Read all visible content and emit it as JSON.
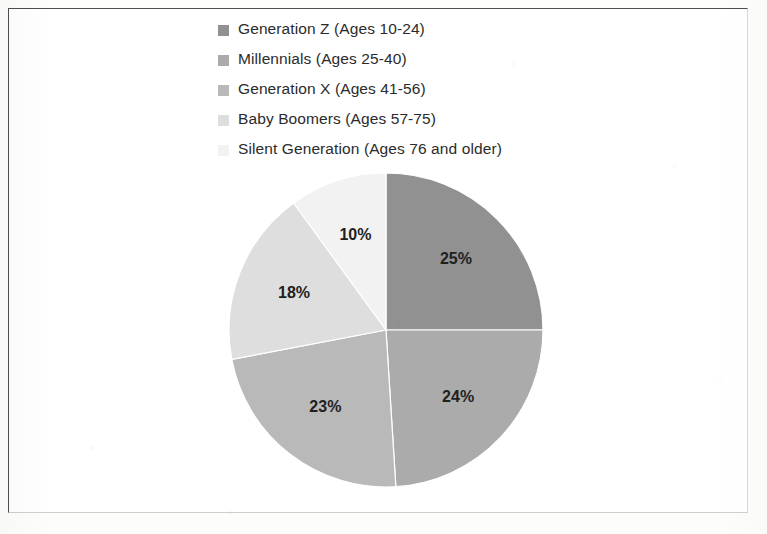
{
  "chart_data": {
    "type": "pie",
    "title": "",
    "subtitle": "",
    "xlabel": "",
    "ylabel": "",
    "grid": false,
    "legend_position": "top-left",
    "start_angle_deg": 0,
    "direction": "clockwise",
    "categories": [
      "Generation Z (Ages 10-24)",
      "Millennials (Ages 25-40)",
      "Generation X (Ages 41-56)",
      "Baby Boomers (Ages 57-75)",
      "Silent Generation (Ages 76 and older)"
    ],
    "values": [
      25,
      24,
      23,
      18,
      10
    ],
    "data_labels": [
      "25%",
      "24%",
      "23%",
      "18%",
      "10%"
    ],
    "colors": [
      "#919191",
      "#ababab",
      "#b9b9b9",
      "#dedede",
      "#f2f2f2"
    ],
    "units": "percent"
  },
  "legend": {
    "items": [
      {
        "label": "Generation Z (Ages 10-24)",
        "color": "#919191"
      },
      {
        "label": "Millennials (Ages 25-40)",
        "color": "#ababab"
      },
      {
        "label": "Generation X (Ages 41-56)",
        "color": "#b9b9b9"
      },
      {
        "label": "Baby Boomers (Ages 57-75)",
        "color": "#dedede"
      },
      {
        "label": "Silent Generation (Ages 76 and older)",
        "color": "#f2f2f2"
      }
    ]
  },
  "frame": {
    "border_color": "#4e4e4e",
    "background": "#ffffff"
  }
}
